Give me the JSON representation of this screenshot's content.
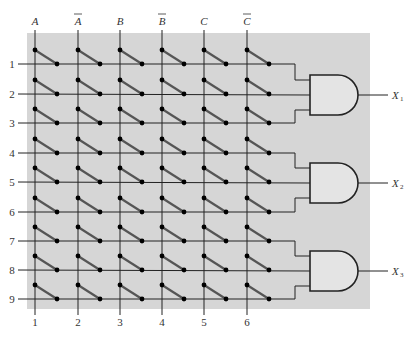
{
  "diagram": {
    "type": "programmable-and-array",
    "colors": {
      "background_panel": "#d6d6d6",
      "gate_fill": "#e4e4e4",
      "wire": "#222222",
      "fuse_link": "#555555",
      "node": "#000000"
    },
    "input_columns": [
      {
        "label": "A",
        "overbar": false,
        "number": "1"
      },
      {
        "label": "A",
        "overbar": true,
        "number": "2"
      },
      {
        "label": "B",
        "overbar": false,
        "number": "3"
      },
      {
        "label": "B",
        "overbar": true,
        "number": "4"
      },
      {
        "label": "C",
        "overbar": false,
        "number": "5"
      },
      {
        "label": "C",
        "overbar": true,
        "number": "6"
      }
    ],
    "rows": [
      "1",
      "2",
      "3",
      "4",
      "5",
      "6",
      "7",
      "8",
      "9"
    ],
    "gates": [
      {
        "type": "AND",
        "inputs": [
          "1",
          "2",
          "3"
        ],
        "output": "X",
        "output_sub": "1"
      },
      {
        "type": "AND",
        "inputs": [
          "4",
          "5",
          "6"
        ],
        "output": "X",
        "output_sub": "2"
      },
      {
        "type": "AND",
        "inputs": [
          "7",
          "8",
          "9"
        ],
        "output": "X",
        "output_sub": "3"
      }
    ]
  }
}
